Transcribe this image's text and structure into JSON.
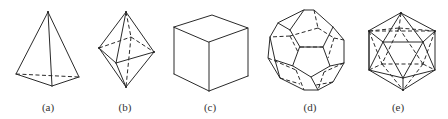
{
  "figure": {
    "panels": [
      {
        "id": "a",
        "label": "(a)",
        "shape": "tetrahedron",
        "label_x": 48
      },
      {
        "id": "b",
        "label": "(b)",
        "shape": "octahedron",
        "label_x": 125
      },
      {
        "id": "c",
        "label": "(c)",
        "shape": "cube",
        "label_x": 210
      },
      {
        "id": "d",
        "label": "(d)",
        "shape": "dodecahedron",
        "label_x": 310
      },
      {
        "id": "e",
        "label": "(e)",
        "shape": "icosahedron",
        "label_x": 398
      }
    ],
    "colors": {
      "stroke": "#2a2a2a",
      "background": "#ffffff",
      "label": "#333333"
    }
  }
}
